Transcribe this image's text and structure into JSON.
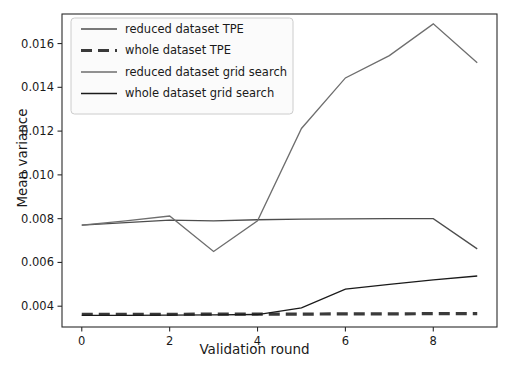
{
  "chart_data": {
    "type": "line",
    "title": "",
    "xlabel": "Validation round",
    "ylabel": "Mean variance",
    "x": [
      0,
      1,
      2,
      3,
      4,
      5,
      6,
      7,
      8,
      9
    ],
    "xlim": [
      -0.45,
      9.45
    ],
    "ylim": [
      0.00305,
      0.01735
    ],
    "xticks": [
      0,
      2,
      4,
      6,
      8
    ],
    "xticklabels": [
      "0",
      "2",
      "4",
      "6",
      "8"
    ],
    "yticks": [
      0.004,
      0.006,
      0.008,
      0.01,
      0.012,
      0.014,
      0.016
    ],
    "yticklabels": [
      "0.004",
      "0.006",
      "0.008",
      "0.010",
      "0.012",
      "0.014",
      "0.016"
    ],
    "grid": false,
    "legend_position": "upper left",
    "series": [
      {
        "name": "reduced dataset TPE",
        "color": "#4d4d4d",
        "linestyle": "solid",
        "linewidth": 1.3,
        "values": [
          0.0077,
          0.00782,
          0.00793,
          0.0079,
          0.00795,
          0.00798,
          0.00799,
          0.008,
          0.008,
          0.00662
        ]
      },
      {
        "name": "whole dataset TPE",
        "color": "#3a3a3a",
        "linestyle": "dashed",
        "linewidth": 3.2,
        "values": [
          0.00363,
          0.00363,
          0.00363,
          0.00364,
          0.00364,
          0.00364,
          0.00365,
          0.00365,
          0.00366,
          0.00366
        ]
      },
      {
        "name": "reduced dataset grid search",
        "color": "#6e6e6e",
        "linestyle": "solid",
        "linewidth": 1.3,
        "values": [
          0.0077,
          0.0079,
          0.00812,
          0.0065,
          0.0079,
          0.01212,
          0.01443,
          0.01545,
          0.0169,
          0.01512
        ]
      },
      {
        "name": "whole dataset grid search",
        "color": "#1a1a1a",
        "linestyle": "solid",
        "linewidth": 1.3,
        "values": [
          0.00358,
          0.00358,
          0.00359,
          0.0036,
          0.00362,
          0.00392,
          0.00478,
          0.005,
          0.0052,
          0.00538
        ]
      }
    ]
  },
  "axes": {
    "spine_color": "#2b2b2b",
    "tick_color": "#2b2b2b",
    "background": "#ffffff"
  },
  "legend": {
    "border_color": "#cccccc",
    "background": "#fbfbfb"
  }
}
